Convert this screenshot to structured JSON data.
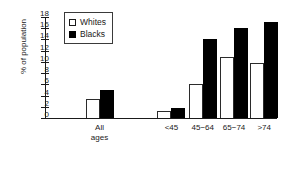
{
  "chart_data": {
    "type": "bar",
    "title": "",
    "xlabel": "",
    "ylabel": "% of population",
    "ylim": [
      0,
      18
    ],
    "ytick_step": 2,
    "yticks": [
      0,
      2,
      4,
      6,
      8,
      10,
      12,
      14,
      16,
      18
    ],
    "grid": false,
    "legend_position": "top-left",
    "categories": [
      "All ages",
      "<45",
      "45−64",
      "65−74",
      ">74"
    ],
    "series": [
      {
        "name": "Whites",
        "color": "#ffffff",
        "edge_color": "#2b2b2b",
        "values": [
          3.3,
          1.2,
          6.0,
          10.8,
          9.8
        ]
      },
      {
        "name": "Blacks",
        "color": "#000000",
        "edge_color": "#000000",
        "values": [
          5.0,
          1.8,
          14.0,
          16.0,
          17.2
        ]
      }
    ]
  },
  "legend": {
    "items": [
      {
        "label": "Whites",
        "swatch": "open-square"
      },
      {
        "label": "Blacks",
        "swatch": "filled-square"
      }
    ]
  },
  "axis": {
    "y_label": "% of population",
    "y_tick_labels": [
      "0",
      "2",
      "4",
      "6",
      "8",
      "10",
      "12",
      "14",
      "16",
      "18"
    ],
    "x_tick_labels": [
      "All\nages",
      "<45",
      "45−64",
      "65−74",
      ">74"
    ]
  }
}
